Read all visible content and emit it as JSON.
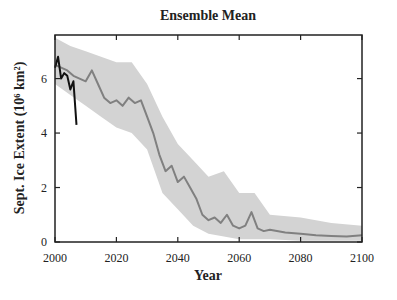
{
  "chart_data": {
    "type": "line",
    "title": "Ensemble Mean",
    "xlabel": "Year",
    "ylabel": "Sept. Ice Extent (10⁶ km²)",
    "xlim": [
      2000,
      2100
    ],
    "ylim": [
      0,
      7.6
    ],
    "xticks": [
      2000,
      2020,
      2040,
      2060,
      2080,
      2100
    ],
    "yticks": [
      0,
      2,
      4,
      6
    ],
    "grid": false,
    "legend": null,
    "series": [
      {
        "name": "Ensemble mean",
        "color": "#808080",
        "x": [
          2000,
          2002,
          2004,
          2006,
          2008,
          2010,
          2012,
          2014,
          2016,
          2018,
          2020,
          2022,
          2024,
          2026,
          2028,
          2030,
          2032,
          2034,
          2036,
          2038,
          2040,
          2042,
          2044,
          2046,
          2048,
          2050,
          2052,
          2054,
          2056,
          2058,
          2060,
          2062,
          2064,
          2066,
          2068,
          2070,
          2075,
          2080,
          2085,
          2090,
          2095,
          2100
        ],
        "values": [
          6.5,
          6.4,
          6.3,
          6.1,
          6.0,
          5.9,
          6.3,
          5.8,
          5.3,
          5.1,
          5.2,
          5.0,
          5.3,
          5.1,
          5.2,
          4.6,
          4.0,
          3.2,
          2.6,
          2.8,
          2.2,
          2.4,
          2.0,
          1.6,
          1.0,
          0.8,
          0.9,
          0.7,
          1.0,
          0.6,
          0.5,
          0.6,
          1.1,
          0.5,
          0.4,
          0.45,
          0.35,
          0.3,
          0.25,
          0.22,
          0.2,
          0.25
        ]
      },
      {
        "name": "Ensemble spread (range)",
        "color": "#d3d3d3",
        "type": "band",
        "x": [
          2000,
          2005,
          2010,
          2015,
          2020,
          2025,
          2030,
          2035,
          2040,
          2045,
          2050,
          2055,
          2060,
          2065,
          2070,
          2080,
          2090,
          2100
        ],
        "lower": [
          5.8,
          5.4,
          5.0,
          4.6,
          4.2,
          4.0,
          3.4,
          1.8,
          1.2,
          0.6,
          0.3,
          0.2,
          0.1,
          0.1,
          0.1,
          0.05,
          0.05,
          0.05
        ],
        "upper": [
          7.5,
          7.2,
          7.0,
          6.8,
          6.6,
          6.6,
          5.8,
          4.6,
          3.6,
          3.0,
          2.4,
          2.6,
          1.8,
          1.8,
          1.0,
          0.9,
          0.7,
          0.6
        ]
      },
      {
        "name": "Observed",
        "color": "#111111",
        "x": [
          2000,
          2001,
          2002,
          2003,
          2004,
          2005,
          2006,
          2007
        ],
        "values": [
          6.4,
          6.8,
          6.0,
          6.2,
          6.1,
          5.6,
          5.9,
          4.3
        ]
      }
    ]
  },
  "plot": {
    "left": 55,
    "right": 362,
    "top": 35,
    "bottom": 242
  }
}
